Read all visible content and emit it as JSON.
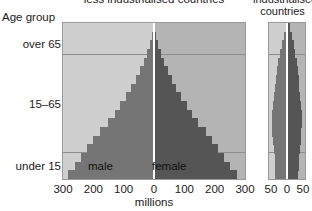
{
  "titles": {
    "main": "less industrialised countries",
    "right_line1": "industrialised",
    "right_line2": "countries"
  },
  "axis": {
    "age_group_label": "Age group",
    "x_axis_title": "millions",
    "y_categories": [
      {
        "label": "over 65"
      },
      {
        "label": "15–65"
      },
      {
        "label": "under 15"
      }
    ],
    "left_xticks": [
      "300",
      "200",
      "100",
      "0",
      "100",
      "200",
      "300"
    ],
    "right_xticks": [
      "50",
      "0",
      "50"
    ]
  },
  "series_labels": {
    "male": "male",
    "female": "female"
  },
  "colors": {
    "male_bar": "#757575",
    "female_bar": "#555555",
    "male_background": "#cfcfcf",
    "female_background": "#b4b4b4",
    "panel_border": "#9a9a9a",
    "gridline": "#8d8d8d",
    "centerline": "#ffffff"
  },
  "chart_data": {
    "type": "bar",
    "title": "less industrialised countries",
    "xlabel": "millions",
    "ylabel": "Age group",
    "orientation": "population-pyramid",
    "grid": true,
    "legend_position": "in-plot",
    "panels": [
      {
        "name": "less industrialised countries",
        "xlim": [
          -300,
          300
        ],
        "xticks": [
          -300,
          -200,
          -100,
          0,
          100,
          200,
          300
        ],
        "xtick_labels": [
          "300",
          "200",
          "100",
          "0",
          "100",
          "200",
          "300"
        ],
        "age_bands": [
          "0-4",
          "5-9",
          "10-14",
          "15-19",
          "20-24",
          "25-29",
          "30-34",
          "35-39",
          "40-44",
          "45-49",
          "50-54",
          "55-59",
          "60-64",
          "65-69",
          "70-74",
          "75-79",
          "80-84",
          "85+"
        ],
        "series": [
          {
            "name": "male",
            "values": [
              285,
              262,
              240,
              222,
              200,
              178,
              152,
              130,
              112,
              92,
              76,
              60,
              46,
              32,
              22,
              13,
              7,
              3
            ]
          },
          {
            "name": "female",
            "values": [
              272,
              250,
              230,
              212,
              192,
              170,
              146,
              126,
              108,
              90,
              74,
              58,
              45,
              32,
              22,
              14,
              8,
              4
            ]
          }
        ],
        "category_bands": [
          {
            "label": "under 15",
            "bands": [
              "0-4",
              "5-9",
              "10-14"
            ]
          },
          {
            "label": "15–65",
            "bands": [
              "15-19",
              "20-24",
              "25-29",
              "30-34",
              "35-39",
              "40-44",
              "45-49",
              "50-54",
              "55-59",
              "60-64"
            ]
          },
          {
            "label": "over 65",
            "bands": [
              "65-69",
              "70-74",
              "75-79",
              "80-84",
              "85+"
            ]
          }
        ]
      },
      {
        "name": "industrialised countries",
        "xlim": [
          -50,
          50
        ],
        "xticks": [
          -50,
          0,
          50
        ],
        "xtick_labels": [
          "50",
          "0",
          "50"
        ],
        "age_bands": [
          "0-4",
          "5-9",
          "10-14",
          "15-19",
          "20-24",
          "25-29",
          "30-34",
          "35-39",
          "40-44",
          "45-49",
          "50-54",
          "55-59",
          "60-64",
          "65-69",
          "70-74",
          "75-79",
          "80-84",
          "85+"
        ],
        "series": [
          {
            "name": "male",
            "values": [
              32,
              33,
              34,
              36,
              40,
              42,
              43,
              42,
              40,
              36,
              33,
              31,
              28,
              24,
              19,
              14,
              8,
              4
            ]
          },
          {
            "name": "female",
            "values": [
              31,
              32,
              33,
              35,
              38,
              40,
              41,
              41,
              39,
              36,
              34,
              32,
              30,
              27,
              23,
              19,
              13,
              8
            ]
          }
        ]
      }
    ]
  }
}
